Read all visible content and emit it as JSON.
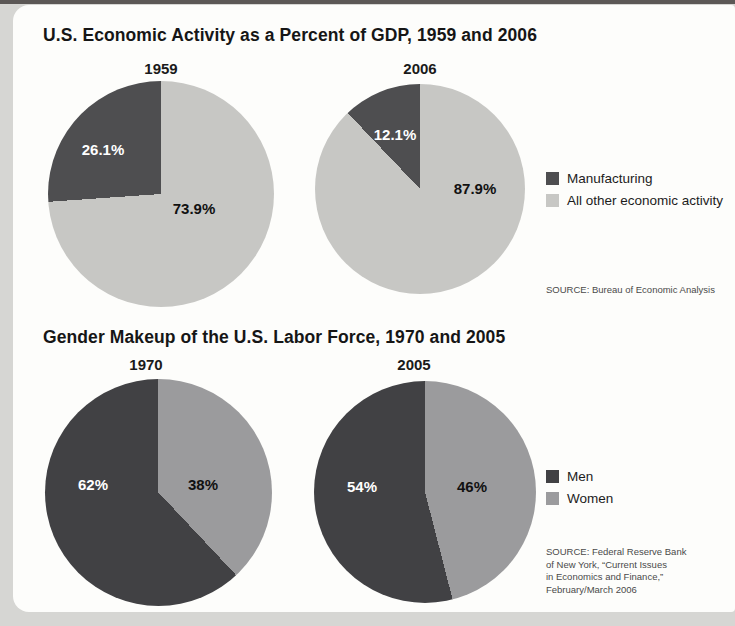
{
  "page": {
    "background_color": "#d6d6d3",
    "card_color": "#fdfdfb"
  },
  "chart_data": [
    {
      "type": "pie",
      "title": "U.S. Economic Activity as a Percent of GDP, 1959 and 2006",
      "legend_position": "right",
      "direction": "counterclockwise",
      "start_angle_deg": 0,
      "legend": [
        {
          "label": "Manufacturing",
          "color": "#4e4e50"
        },
        {
          "label": "All other economic activity",
          "color": "#c7c7c4"
        }
      ],
      "source_lines": [
        "SOURCE: Bureau of Economic Analysis"
      ],
      "pies": [
        {
          "year": "1959",
          "slices": [
            {
              "name": "Manufacturing",
              "value": 26.1,
              "display": "26.1%",
              "color": "#4e4e50"
            },
            {
              "name": "All other economic activity",
              "value": 73.9,
              "display": "73.9%",
              "color": "#c7c7c4"
            }
          ]
        },
        {
          "year": "2006",
          "slices": [
            {
              "name": "Manufacturing",
              "value": 12.1,
              "display": "12.1%",
              "color": "#4e4e50"
            },
            {
              "name": "All other economic activity",
              "value": 87.9,
              "display": "87.9%",
              "color": "#c7c7c4"
            }
          ]
        }
      ]
    },
    {
      "type": "pie",
      "title": "Gender Makeup of the U.S. Labor Force, 1970 and 2005",
      "legend_position": "right",
      "direction": "counterclockwise",
      "start_angle_deg": 0,
      "legend": [
        {
          "label": "Men",
          "color": "#414144"
        },
        {
          "label": "Women",
          "color": "#9b9b9d"
        }
      ],
      "source_lines": [
        "SOURCE: Federal Reserve Bank",
        "of New York, “Current Issues",
        "in Economics and Finance,”",
        "February/March 2006"
      ],
      "pies": [
        {
          "year": "1970",
          "slices": [
            {
              "name": "Men",
              "value": 62,
              "display": "62%",
              "color": "#414144"
            },
            {
              "name": "Women",
              "value": 38,
              "display": "38%",
              "color": "#9b9b9d"
            }
          ]
        },
        {
          "year": "2005",
          "slices": [
            {
              "name": "Men",
              "value": 54,
              "display": "54%",
              "color": "#414144"
            },
            {
              "name": "Women",
              "value": 46,
              "display": "46%",
              "color": "#9b9b9d"
            }
          ]
        }
      ]
    }
  ]
}
